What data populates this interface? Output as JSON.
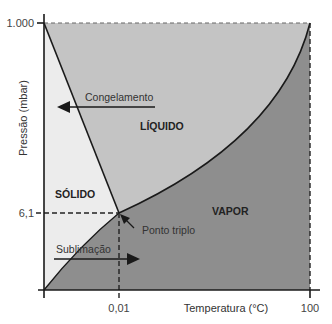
{
  "diagram": {
    "type": "phase-diagram",
    "axes": {
      "x_label": "Temperatura (°C)",
      "y_label": "Pressão (mbar)",
      "x_ticks": [
        "0,01",
        "100"
      ],
      "y_ticks": [
        "1.000",
        "6,1"
      ]
    },
    "regions": {
      "solid": "SÓLIDO",
      "liquid": "LÍQUIDO",
      "vapor": "VAPOR"
    },
    "annotations": {
      "freezing": "Congelamento",
      "sublimation": "Sublimação",
      "triple_point": "Ponto triplo"
    },
    "colors": {
      "solid": "#ececec",
      "liquid": "#c4c4c4",
      "vapor": "#8e8e8e",
      "lines": "#1a1a1a"
    }
  }
}
